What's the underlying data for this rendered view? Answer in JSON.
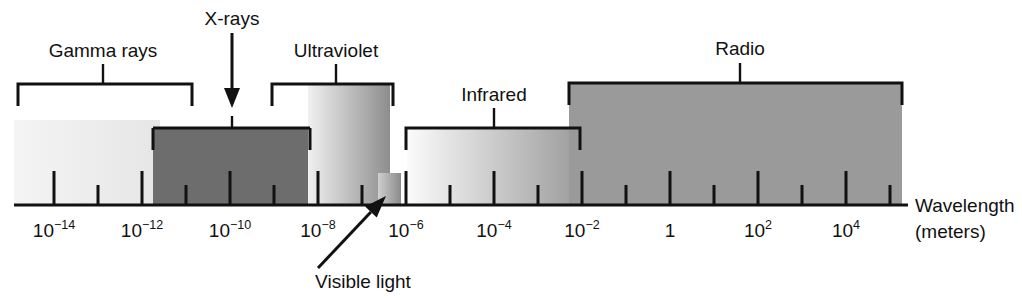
{
  "figure": {
    "name": "electromagnetic-spectrum-diagram",
    "background_color": "#ffffff",
    "line_color": "#111111",
    "width": 1022,
    "height": 302
  },
  "axis": {
    "title_line1": "Wavelength",
    "title_line2": "(meters)",
    "baseline_y": 205,
    "start_x": 14,
    "end_x": 908,
    "major_tick_labels": [
      {
        "base": "10",
        "exp": "−14",
        "display": "10⁻¹⁴",
        "x": 54
      },
      {
        "base": "10",
        "exp": "−12",
        "display": "10⁻¹²",
        "x": 142
      },
      {
        "base": "10",
        "exp": "−10",
        "display": "10⁻¹⁰",
        "x": 230
      },
      {
        "base": "10",
        "exp": "−8",
        "display": "10⁻⁸",
        "x": 318
      },
      {
        "base": "10",
        "exp": "−6",
        "display": "10⁻⁶",
        "x": 406
      },
      {
        "base": "10",
        "exp": "−4",
        "display": "10⁻⁴",
        "x": 494
      },
      {
        "base": "10",
        "exp": "−2",
        "display": "10⁻²",
        "x": 582
      },
      {
        "base": "1",
        "exp": "",
        "display": "1",
        "x": 670
      },
      {
        "base": "10",
        "exp": "2",
        "display": "10²",
        "x": 758
      },
      {
        "base": "10",
        "exp": "4",
        "display": "10⁴",
        "x": 846
      }
    ],
    "minor_tick_x": [
      98,
      186,
      274,
      362,
      450,
      538,
      626,
      714,
      802,
      890
    ],
    "major_tick_height": 34,
    "minor_tick_height": 20
  },
  "bands": [
    {
      "id": "gamma-rays",
      "label": "Gamma rays",
      "label_x": 103,
      "label_y": 57,
      "bracket_left": 18,
      "bracket_right": 192,
      "bracket_y": 84,
      "leader_x": 103,
      "block_left": 14,
      "block_right": 160,
      "block_top": 120,
      "fill_left": "#f4f4f4",
      "fill_right": "#e6e6e6",
      "has_bracket": true,
      "has_block": true
    },
    {
      "id": "x-rays",
      "label": "X-rays",
      "label_x": 232,
      "label_y": 25,
      "arrow_x": 232,
      "arrow_top": 33,
      "arrow_tip_y": 108,
      "block_left": 153,
      "block_right": 310,
      "block_top": 128,
      "fill_left": "#6d6d6d",
      "fill_right": "#6d6d6d",
      "has_bracket": false,
      "has_block": true
    },
    {
      "id": "ultraviolet",
      "label": "Ultraviolet",
      "label_x": 336,
      "label_y": 57,
      "bracket_left": 272,
      "bracket_right": 393,
      "bracket_y": 84,
      "leader_x": 336,
      "block_left": 308,
      "block_right": 390,
      "block_top": 83,
      "fill_left": "#f0f0f0",
      "fill_right": "#8d8d8d",
      "has_bracket": true,
      "has_block": true
    },
    {
      "id": "visible-light",
      "label": "Visible light",
      "label_x": 363,
      "label_y": 288,
      "arrow_tail_x": 318,
      "arrow_tail_y": 268,
      "arrow_tip_x": 386,
      "arrow_tip_y": 196,
      "block_left": 378,
      "block_right": 401,
      "block_top": 173,
      "fill_left": "#cfcfcf",
      "fill_right": "#8a8a8a",
      "has_bracket": false,
      "has_block": true
    },
    {
      "id": "infrared",
      "label": "Infrared",
      "label_x": 494,
      "label_y": 101,
      "bracket_left": 406,
      "bracket_right": 580,
      "bracket_y": 128,
      "leader_x": 494,
      "block_left": 407,
      "block_right": 580,
      "block_top": 128,
      "fill_left": "#fbfbfb",
      "fill_right": "#9c9c9c",
      "has_bracket": true,
      "has_block": true
    },
    {
      "id": "radio",
      "label": "Radio",
      "label_x": 740,
      "label_y": 55,
      "bracket_left": 569,
      "bracket_right": 902,
      "bracket_y": 83,
      "leader_x": 740,
      "block_left": 569,
      "block_right": 902,
      "block_top": 83,
      "fill_left": "#9a9a9a",
      "fill_right": "#9a9a9a",
      "has_bracket": true,
      "has_block": true
    }
  ],
  "chart_data": {
    "type": "bar",
    "title": "",
    "xlabel": "Wavelength (meters)",
    "ylabel": "",
    "axis_scale": "log10",
    "xlim_exponent": [
      -15,
      5
    ],
    "grid": false,
    "legend_position": "none",
    "categories": [
      "Gamma rays",
      "X-rays",
      "Ultraviolet",
      "Visible light",
      "Infrared",
      "Radio"
    ],
    "series": [
      {
        "name": "Wavelength range (meters, log10 exponent)",
        "ranges": [
          {
            "category": "Gamma rays",
            "min_exp": -15,
            "max_exp": -11.7
          },
          {
            "category": "X-rays",
            "min_exp": -11.5,
            "max_exp": -8.0
          },
          {
            "category": "Ultraviolet",
            "min_exp": -8.05,
            "max_exp": -6.2
          },
          {
            "category": "Visible light",
            "min_exp": -6.45,
            "max_exp": -5.9
          },
          {
            "category": "Infrared",
            "min_exp": -5.85,
            "max_exp": -2.0
          },
          {
            "category": "Radio",
            "min_exp": -1.75,
            "max_exp": 5.8
          }
        ]
      }
    ],
    "tick_labels": [
      "10⁻¹⁴",
      "10⁻¹²",
      "10⁻¹⁰",
      "10⁻⁸",
      "10⁻⁶",
      "10⁻⁴",
      "10⁻²",
      "1",
      "10²",
      "10⁴"
    ],
    "annotations": [
      "Gamma rays",
      "X-rays",
      "Ultraviolet",
      "Visible light",
      "Infrared",
      "Radio",
      "Wavelength (meters)"
    ]
  }
}
